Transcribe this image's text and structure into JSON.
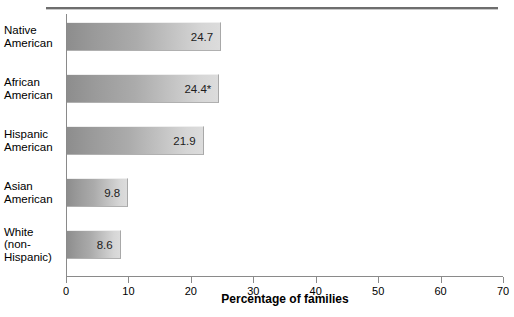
{
  "chart_data": {
    "type": "bar",
    "orientation": "horizontal",
    "title": "",
    "categories": [
      "Native American",
      "African American",
      "Hispanic American",
      "Asian American",
      "White (non-Hispanic)"
    ],
    "category_lines": [
      [
        "Native",
        "American"
      ],
      [
        "African",
        "American"
      ],
      [
        "Hispanic",
        "American"
      ],
      [
        "Asian",
        "American"
      ],
      [
        "White",
        "(non-",
        "Hispanic)"
      ]
    ],
    "values": [
      24.7,
      24.4,
      21.9,
      9.8,
      8.6
    ],
    "value_labels": [
      "24.7",
      "24.4*",
      "21.9",
      "9.8",
      "8.6"
    ],
    "xlabel": "Percentage of families",
    "ylabel": "",
    "xlim": [
      0,
      70
    ],
    "xticks": [
      0,
      10,
      20,
      30,
      40,
      50,
      60,
      70
    ],
    "xtick_labels": [
      "0",
      "10",
      "20",
      "30",
      "40",
      "50",
      "60",
      "70"
    ],
    "grid": false,
    "legend": null,
    "footnote_marker": "*",
    "bar_gradient_from": "#8d8d8d",
    "bar_gradient_to": "#dcdcdc",
    "axis_color": "#8a8a8a",
    "text_color": "#000000"
  },
  "cropped_heading": ""
}
